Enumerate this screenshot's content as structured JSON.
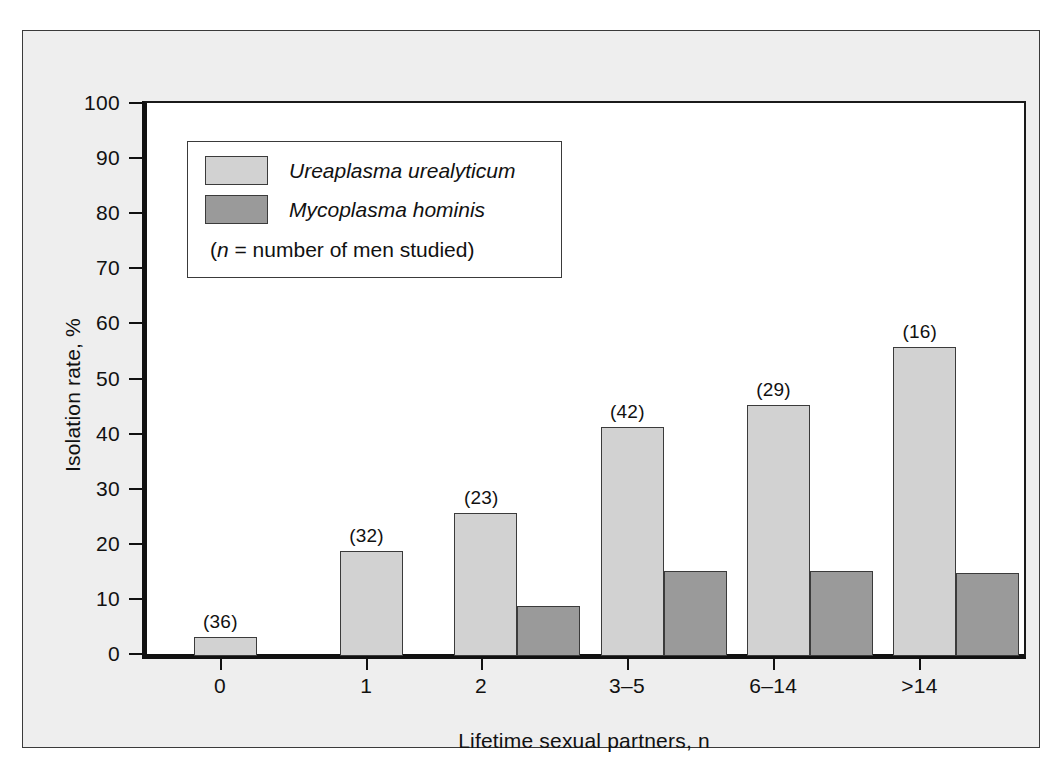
{
  "chart_data": {
    "type": "bar",
    "title": "",
    "xlabel": "Lifetime sexual partners, n",
    "ylabel": "Isolation rate, %",
    "categories": [
      "0",
      "1",
      "2",
      "3–5",
      "6–14",
      ">14"
    ],
    "point_labels": [
      "(36)",
      "(32)",
      "(23)",
      "(42)",
      "(29)",
      "(16)"
    ],
    "series": [
      {
        "name": "Ureaplasma urealyticum",
        "color": "#d2d2d2",
        "values": [
          3.5,
          19,
          26,
          41.5,
          45.5,
          56
        ]
      },
      {
        "name": "Mycoplasma hominis",
        "color": "#9a9a9a",
        "values": [
          0,
          0,
          9,
          15.5,
          15.5,
          15
        ]
      }
    ],
    "ylim": [
      0,
      100
    ],
    "y_ticks": [
      0,
      10,
      20,
      30,
      40,
      50,
      60,
      70,
      80,
      90,
      100
    ],
    "y_tick_labels": [
      "0",
      "10",
      "20",
      "30",
      "40",
      "50",
      "60",
      "70",
      "80",
      "90",
      "100"
    ],
    "grid": false,
    "legend_position": "upper-left",
    "legend_note_prefix": "(",
    "legend_note_italic": "n",
    "legend_note_suffix": " = number of men studied)"
  },
  "colors": {
    "series_light": "#d2d2d2",
    "series_dark": "#9a9a9a",
    "axis": "#111111",
    "frame_background": "#eeeeee",
    "plot_background": "#ffffff",
    "border": "#3a3a3a"
  }
}
